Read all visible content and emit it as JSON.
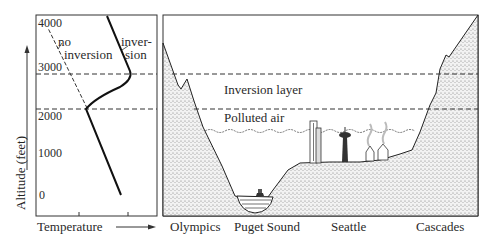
{
  "left_panel": {
    "y_axis_label": "Altitude (feet)",
    "x_axis_label": "Temperature",
    "ticks": [
      "4000",
      "3000",
      "2000",
      "1000",
      "0"
    ],
    "curves": [
      {
        "name": "no inversion",
        "label_line1": "no",
        "label_line2": "inversion",
        "style": "dashed"
      },
      {
        "name": "inversion",
        "label_line1": "inver-",
        "label_line2": "sion",
        "style": "solid"
      }
    ]
  },
  "right_panel": {
    "layers": {
      "inversion": "Inversion layer",
      "polluted": "Polluted air"
    },
    "places": [
      "Olympics",
      "Puget Sound",
      "Seattle",
      "Cascades"
    ]
  },
  "colors": {
    "ink": "#222222",
    "stipple": "#bdbdbd",
    "background": "#ffffff"
  }
}
